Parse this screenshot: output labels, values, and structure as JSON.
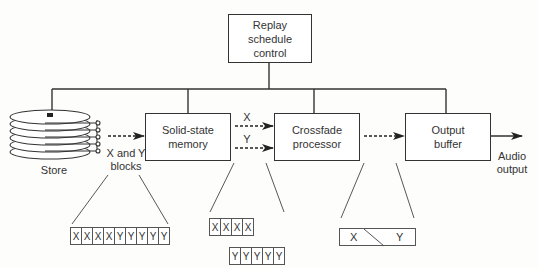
{
  "diagram": {
    "control": {
      "label": "Replay schedule control",
      "lines": [
        "Replay",
        "schedule",
        "control"
      ]
    },
    "blocks": [
      {
        "id": "solid-state-memory",
        "lines": [
          "Solid-state",
          "memory"
        ]
      },
      {
        "id": "crossfade-processor",
        "lines": [
          "Crossfade",
          "processor"
        ]
      },
      {
        "id": "output-buffer",
        "lines": [
          "Output",
          "buffer"
        ]
      }
    ],
    "store": {
      "label": "Store"
    },
    "labels": {
      "xy_blocks": [
        "X and Y",
        "blocks"
      ],
      "x_path": "X",
      "y_path": "Y",
      "audio_output": [
        "Audio",
        "output"
      ]
    },
    "details": {
      "store_blocks": [
        "X",
        "X",
        "X",
        "X",
        "Y",
        "Y",
        "Y",
        "Y",
        "Y"
      ],
      "memory_x_blocks": [
        "X",
        "X",
        "X",
        "X"
      ],
      "memory_y_blocks": [
        "Y",
        "Y",
        "Y",
        "Y",
        "Y"
      ],
      "crossfade_output": {
        "left": "X",
        "right": "Y"
      }
    },
    "colors": {
      "line": "#333333",
      "background": "#fdfdfc"
    }
  }
}
